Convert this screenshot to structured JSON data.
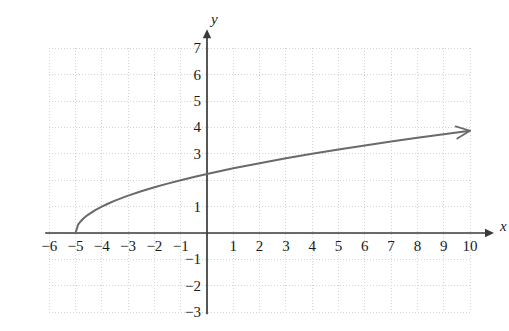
{
  "figure": {
    "kind": "cartesian-graph",
    "background_color": "#ffffff",
    "curve_color": "#6a6a6a",
    "axis_color": "#3a3a3a",
    "grid_color": "#cfcfcf",
    "text_color": "#1a1a1a"
  },
  "chart_data": {
    "type": "line",
    "title": "",
    "xlabel": "x",
    "ylabel": "y",
    "xlim": [
      -6,
      10
    ],
    "ylim": [
      -3,
      7
    ],
    "grid": true,
    "grid_style": "dotted",
    "grid_spacing": 1,
    "legend": "none",
    "equation": "y = sqrt(x + 5)",
    "domain_start": -5,
    "domain_end": 10,
    "arrow_end": "right",
    "x_ticks": [
      -6,
      -5,
      -4,
      -3,
      -2,
      -1,
      1,
      2,
      3,
      4,
      5,
      6,
      7,
      8,
      9,
      10
    ],
    "x_tick_labels": [
      "−6",
      "−5",
      "−4",
      "−3",
      "−2",
      "−1",
      "1",
      "2",
      "3",
      "4",
      "5",
      "6",
      "7",
      "8",
      "9",
      "10"
    ],
    "y_ticks": [
      7,
      6,
      5,
      4,
      3,
      1,
      -1,
      -2,
      -3
    ],
    "y_tick_labels": [
      "7",
      "6",
      "5",
      "4",
      "3",
      "1",
      "−1",
      "−2",
      "−3"
    ],
    "x": [
      -5,
      -4.9,
      -4.8,
      -4.7,
      -4.6,
      -4.5,
      -4.25,
      -4,
      -3.75,
      -3.5,
      -3,
      -2.5,
      -2,
      -1.5,
      -1,
      -0.5,
      0,
      1,
      2,
      3,
      4,
      5,
      6,
      7,
      8,
      9,
      10
    ],
    "y": [
      0,
      0.316,
      0.447,
      0.548,
      0.632,
      0.707,
      0.866,
      1,
      1.118,
      1.225,
      1.414,
      1.581,
      1.732,
      1.871,
      2,
      2.121,
      2.236,
      2.449,
      2.646,
      2.828,
      3,
      3.162,
      3.317,
      3.464,
      3.606,
      3.742,
      3.873
    ]
  },
  "axis_labels": {
    "x_axis_name": "x",
    "y_axis_name": "y"
  }
}
